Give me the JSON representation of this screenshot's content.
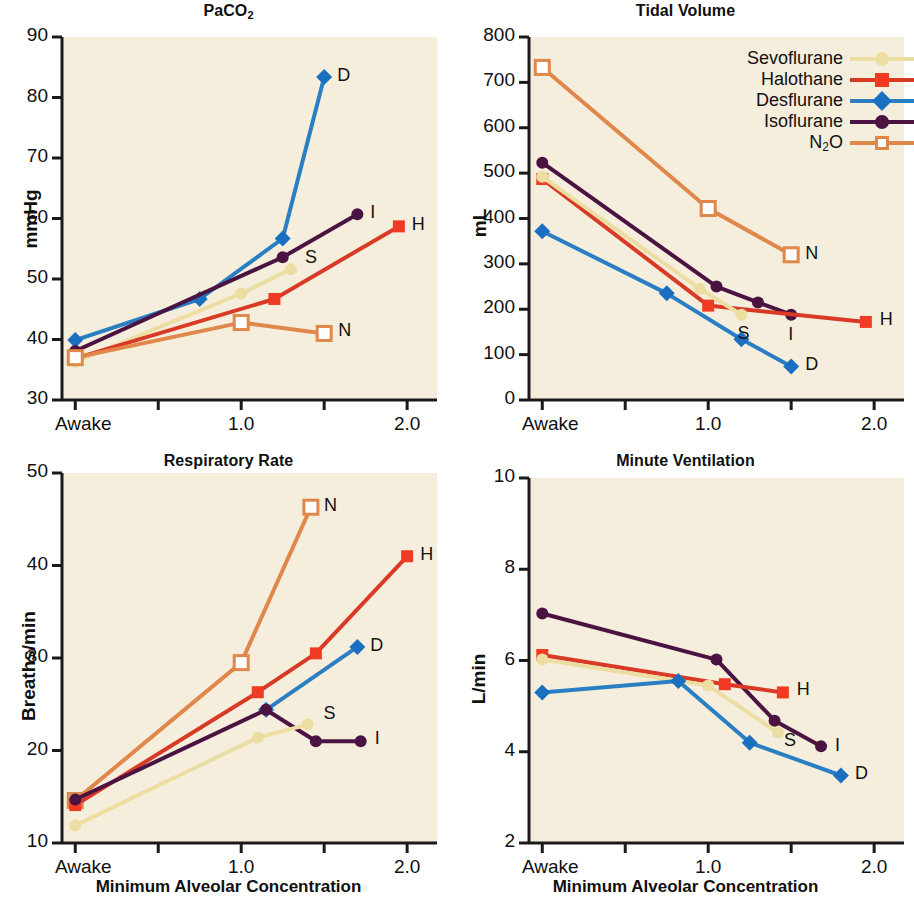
{
  "figure": {
    "background": "#ffffff",
    "plot_background": "#f6eedc"
  },
  "legend": {
    "position": "top-right of tidal-volume panel",
    "entries": [
      {
        "label": "Sevoflurane",
        "key": "sevoflurane",
        "color": "#ecdda2",
        "marker": "circle"
      },
      {
        "label": "Halothane",
        "key": "halothane",
        "color": "#d93a26",
        "marker": "square"
      },
      {
        "label": "Desflurane",
        "key": "desflurane",
        "color": "#2a7fc4",
        "marker": "diamond"
      },
      {
        "label": "Isoflurane",
        "key": "isoflurane",
        "color": "#4a1342",
        "marker": "circle"
      },
      {
        "label": "N₂O",
        "key": "n2o",
        "color": "#e0874c",
        "marker": "square-open"
      }
    ]
  },
  "shared": {
    "xlabel": "Minimum Alveolar Concentration",
    "xticks": [
      0.0,
      0.5,
      1.0,
      1.5,
      2.0
    ],
    "xtick_labels": [
      "Awake",
      "",
      "1.0",
      "",
      "2.0"
    ],
    "xlim": [
      -0.08,
      2.18
    ]
  },
  "chart_data": [
    {
      "id": "paco2",
      "type": "line",
      "title": "PaCO2",
      "title_html": "PaCO<sub>2</sub>",
      "ylabel": "mmHg",
      "xlabel": "Minimum Alveolar Concentration",
      "ylim": [
        30,
        90
      ],
      "yticks": [
        30,
        40,
        50,
        60,
        70,
        80,
        90
      ],
      "xlim": [
        -0.08,
        2.18
      ],
      "xticks": [
        0.0,
        0.5,
        1.0,
        1.5,
        2.0
      ],
      "xtick_labels": [
        "Awake",
        "",
        "1.0",
        "",
        "2.0"
      ],
      "grid": false,
      "series": [
        {
          "name": "Desflurane",
          "key": "desflurane",
          "color": "#2a7fc4",
          "marker": "diamond",
          "end_label": "D",
          "x": [
            0.0,
            0.75,
            1.25,
            1.5
          ],
          "y": [
            39.9,
            46.7,
            56.7,
            83.4
          ]
        },
        {
          "name": "Isoflurane",
          "key": "isoflurane",
          "color": "#4a1342",
          "marker": "circle",
          "end_label": "I",
          "x": [
            0.0,
            1.25,
            1.7
          ],
          "y": [
            38.1,
            53.6,
            60.7
          ]
        },
        {
          "name": "Sevoflurane",
          "key": "sevoflurane",
          "color": "#ecdda2",
          "marker": "circle",
          "end_label": "S",
          "x": [
            0.0,
            1.0,
            1.3
          ],
          "y": [
            36.3,
            47.6,
            51.6
          ]
        },
        {
          "name": "Halothane",
          "key": "halothane",
          "color": "#d93a26",
          "marker": "square",
          "end_label": "H",
          "x": [
            0.0,
            1.2,
            1.95
          ],
          "y": [
            36.9,
            46.7,
            58.7
          ]
        },
        {
          "name": "N2O",
          "key": "n2o",
          "color": "#e0874c",
          "marker": "square-open",
          "end_label": "N",
          "x": [
            0.0,
            1.0,
            1.5
          ],
          "y": [
            37.0,
            42.8,
            41.0
          ]
        }
      ]
    },
    {
      "id": "tidal-volume",
      "type": "line",
      "title": "Tidal Volume",
      "title_html": "Tidal Volume",
      "ylabel": "mL",
      "xlabel": "Minimum Alveolar Concentration",
      "ylim": [
        0,
        800
      ],
      "yticks": [
        0,
        100,
        200,
        300,
        400,
        500,
        600,
        700,
        800
      ],
      "xlim": [
        -0.08,
        2.18
      ],
      "xticks": [
        0.0,
        0.5,
        1.0,
        1.5,
        2.0
      ],
      "xtick_labels": [
        "Awake",
        "",
        "1.0",
        "",
        "2.0"
      ],
      "grid": false,
      "series": [
        {
          "name": "N2O",
          "key": "n2o",
          "color": "#e0874c",
          "marker": "square-open",
          "end_label": "N",
          "x": [
            0.0,
            1.0,
            1.5
          ],
          "y": [
            733,
            422,
            320
          ]
        },
        {
          "name": "Isoflurane",
          "key": "isoflurane",
          "color": "#4a1342",
          "marker": "circle",
          "end_label": "I",
          "x": [
            0.0,
            1.05,
            1.3,
            1.5
          ],
          "y": [
            523,
            250,
            215,
            188
          ]
        },
        {
          "name": "Halothane",
          "key": "halothane",
          "color": "#d93a26",
          "marker": "square",
          "end_label": "H",
          "x": [
            0.0,
            1.0,
            1.95
          ],
          "y": [
            487,
            208,
            172
          ]
        },
        {
          "name": "Sevoflurane",
          "key": "sevoflurane",
          "color": "#ecdda2",
          "marker": "circle",
          "end_label": "S",
          "x": [
            0.0,
            0.95,
            1.2
          ],
          "y": [
            492,
            245,
            188
          ]
        },
        {
          "name": "Desflurane",
          "key": "desflurane",
          "color": "#2a7fc4",
          "marker": "diamond",
          "end_label": "D",
          "x": [
            0.0,
            0.75,
            1.2,
            1.5
          ],
          "y": [
            372,
            235,
            134,
            74
          ]
        }
      ]
    },
    {
      "id": "respiratory-rate",
      "type": "line",
      "title": "Respiratory Rate",
      "title_html": "Respiratory Rate",
      "ylabel": "Breaths/min",
      "xlabel": "Minimum Alveolar Concentration",
      "ylim": [
        10,
        50
      ],
      "yticks": [
        10,
        20,
        30,
        40,
        50
      ],
      "xlim": [
        -0.08,
        2.18
      ],
      "xticks": [
        0.0,
        0.5,
        1.0,
        1.5,
        2.0
      ],
      "xtick_labels": [
        "Awake",
        "",
        "1.0",
        "",
        "2.0"
      ],
      "grid": false,
      "series": [
        {
          "name": "N2O",
          "key": "n2o",
          "color": "#e0874c",
          "marker": "square-open",
          "end_label": "N",
          "x": [
            0.0,
            1.0,
            1.42
          ],
          "y": [
            14.6,
            29.5,
            46.3
          ]
        },
        {
          "name": "Halothane",
          "key": "halothane",
          "color": "#d93a26",
          "marker": "square",
          "end_label": "H",
          "x": [
            0.0,
            1.1,
            1.45,
            2.0
          ],
          "y": [
            14.1,
            26.3,
            30.5,
            41.0
          ]
        },
        {
          "name": "Desflurane",
          "key": "desflurane",
          "color": "#2a7fc4",
          "marker": "diamond",
          "end_label": "D",
          "x": [
            1.15,
            1.7
          ],
          "y": [
            24.4,
            31.2
          ]
        },
        {
          "name": "Isoflurane",
          "key": "isoflurane",
          "color": "#4a1342",
          "marker": "circle",
          "end_label": "I",
          "x": [
            0.0,
            1.15,
            1.45,
            1.72
          ],
          "y": [
            14.7,
            24.4,
            21.0,
            21.0
          ]
        },
        {
          "name": "Sevoflurane",
          "key": "sevoflurane",
          "color": "#ecdda2",
          "marker": "circle",
          "end_label": "S",
          "x": [
            0.0,
            1.1,
            1.4
          ],
          "y": [
            11.9,
            21.4,
            22.8
          ]
        }
      ]
    },
    {
      "id": "minute-ventilation",
      "type": "line",
      "title": "Minute Ventilation",
      "title_html": "Minute Ventilation",
      "ylabel": "L/min",
      "xlabel": "Minimum Alveolar Concentration",
      "ylim": [
        2,
        10
      ],
      "yticks": [
        2,
        4,
        6,
        8,
        10
      ],
      "xlim": [
        -0.08,
        2.18
      ],
      "xticks": [
        0.0,
        0.5,
        1.0,
        1.5,
        2.0
      ],
      "xtick_labels": [
        "Awake",
        "",
        "1.0",
        "",
        "2.0"
      ],
      "grid": false,
      "series": [
        {
          "name": "Isoflurane",
          "key": "isoflurane",
          "color": "#4a1342",
          "marker": "circle",
          "end_label": "I",
          "x": [
            0.0,
            1.05,
            1.4,
            1.68
          ],
          "y": [
            7.03,
            6.02,
            4.68,
            4.12
          ]
        },
        {
          "name": "Halothane",
          "key": "halothane",
          "color": "#d93a26",
          "marker": "square",
          "end_label": "H",
          "x": [
            0.0,
            1.1,
            1.45
          ],
          "y": [
            6.12,
            5.48,
            5.3
          ]
        },
        {
          "name": "Sevoflurane",
          "key": "sevoflurane",
          "color": "#ecdda2",
          "marker": "circle",
          "end_label": "S",
          "x": [
            0.0,
            1.0,
            1.42
          ],
          "y": [
            6.02,
            5.45,
            4.42
          ]
        },
        {
          "name": "Desflurane",
          "key": "desflurane",
          "color": "#2a7fc4",
          "marker": "diamond",
          "end_label": "D",
          "x": [
            0.0,
            0.82,
            1.25,
            1.8
          ],
          "y": [
            5.3,
            5.55,
            4.2,
            3.48
          ]
        }
      ]
    }
  ]
}
